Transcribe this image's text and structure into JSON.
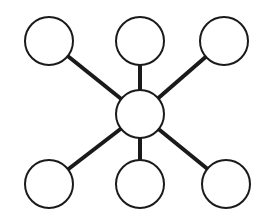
{
  "diagram": {
    "type": "hub-and-spoke",
    "width": 269,
    "height": 224,
    "background": "#ffffff",
    "stroke_color": "#1a1a1a",
    "node_fill": "#ffffff",
    "node_stroke_width": 2,
    "edge_stroke_width": 4,
    "node_radius": 24,
    "hub": {
      "id": "hub",
      "cx": 140,
      "cy": 114
    },
    "nodes": [
      {
        "id": "top-left",
        "cx": 49,
        "cy": 41
      },
      {
        "id": "top-center",
        "cx": 140,
        "cy": 41
      },
      {
        "id": "top-right",
        "cx": 224,
        "cy": 41
      },
      {
        "id": "bottom-left",
        "cx": 49,
        "cy": 184
      },
      {
        "id": "bottom-center",
        "cx": 140,
        "cy": 184
      },
      {
        "id": "bottom-right",
        "cx": 226,
        "cy": 184
      }
    ],
    "edges": [
      {
        "from": "hub",
        "to": "top-left"
      },
      {
        "from": "hub",
        "to": "top-center"
      },
      {
        "from": "hub",
        "to": "top-right"
      },
      {
        "from": "hub",
        "to": "bottom-left"
      },
      {
        "from": "hub",
        "to": "bottom-center"
      },
      {
        "from": "hub",
        "to": "bottom-right"
      }
    ]
  }
}
